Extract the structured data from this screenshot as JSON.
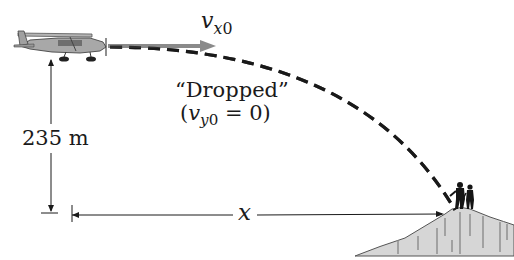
{
  "diagram": {
    "type": "projectile-motion",
    "labels": {
      "velocity_symbol": "v",
      "velocity_subscript_var": "x",
      "velocity_subscript_num": "0",
      "dropped_text": "“Dropped”",
      "condition_open": "(",
      "condition_symbol": "v",
      "condition_subscript_var": "y",
      "condition_subscript_num": "0",
      "condition_rest": " = 0)",
      "height": "235 m",
      "horizontal_distance": "x"
    },
    "objects": {
      "plane": "airplane",
      "trajectory": "dashed parabolic path",
      "velocity_arrow": "horizontal gray arrow",
      "target": "hikers on hilltop",
      "terrain": "hill"
    },
    "colors": {
      "line": "#1a1a1a",
      "arrow": "#8a8a8a",
      "hill": "#d4d4d4",
      "plane": "#9a9a9a"
    }
  }
}
